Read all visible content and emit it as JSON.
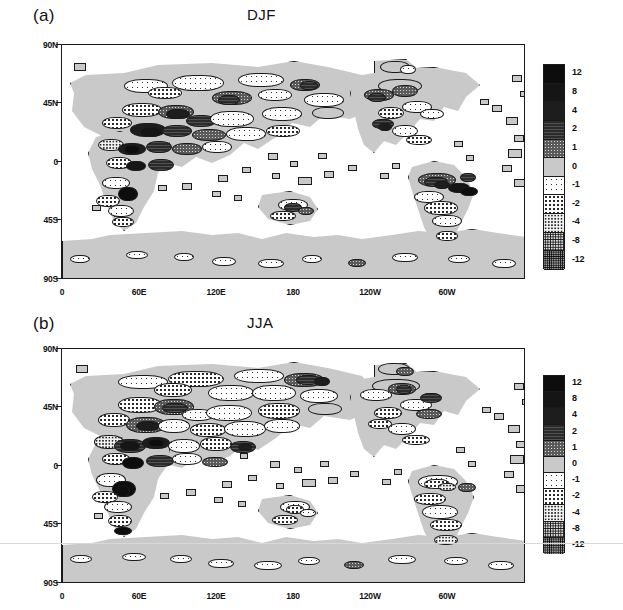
{
  "figure": {
    "panels": [
      {
        "tag": "(a)",
        "title": "DJF",
        "axes": {
          "ylabels": [
            "90N",
            "45N",
            "0",
            "45S",
            "90S"
          ],
          "xlabels": [
            "0",
            "60E",
            "120E",
            "180",
            "120W",
            "60W"
          ],
          "ylim": [
            -90,
            90
          ],
          "xlim": [
            0,
            360
          ]
        }
      },
      {
        "tag": "(b)",
        "title": "JJA",
        "axes": {
          "ylabels": [
            "90N",
            "45N",
            "0",
            "45S",
            "90S"
          ],
          "xlabels": [
            "0",
            "60E",
            "120E",
            "180",
            "120W",
            "60W"
          ],
          "ylim": [
            -90,
            90
          ],
          "xlim": [
            0,
            360
          ]
        }
      }
    ],
    "colorbar": {
      "labels": [
        "12",
        "8",
        "4",
        "2",
        "1",
        "0",
        "-1",
        "-2",
        "-4",
        "-8",
        "-12"
      ],
      "classes": [
        "f-p12",
        "f-p8",
        "f-p4",
        "f-p2",
        "f-p1",
        "f-p0",
        "f-m1",
        "f-m2",
        "f-m4",
        "f-m8",
        "f-m12"
      ]
    }
  },
  "chart_data": {
    "type": "heatmap",
    "panels": [
      {
        "label": "(a)",
        "title": "DJF",
        "xlabel": "",
        "ylabel": "",
        "xlim": [
          0,
          360
        ],
        "ylim": [
          -90,
          90
        ],
        "xticks": [
          0,
          60,
          120,
          180,
          240,
          300
        ],
        "xticklabels": [
          "0",
          "60E",
          "120E",
          "180",
          "120W",
          "60W"
        ],
        "yticks": [
          90,
          45,
          0,
          -45,
          -90
        ],
        "yticklabels": [
          "90N",
          "45N",
          "0",
          "45S",
          "90S"
        ],
        "grid": false
      },
      {
        "label": "(b)",
        "title": "JJA",
        "xlabel": "",
        "ylabel": "",
        "xlim": [
          0,
          360
        ],
        "ylim": [
          -90,
          90
        ],
        "xticks": [
          0,
          60,
          120,
          180,
          240,
          300
        ],
        "xticklabels": [
          "0",
          "60E",
          "120E",
          "180",
          "120W",
          "60W"
        ],
        "yticks": [
          90,
          45,
          0,
          -45,
          -90
        ],
        "yticklabels": [
          "90N",
          "45N",
          "0",
          "45S",
          "90S"
        ],
        "grid": false
      }
    ],
    "colorbar": {
      "orientation": "vertical",
      "tick_values": [
        12,
        8,
        4,
        2,
        1,
        0,
        -1,
        -2,
        -4,
        -8,
        -12
      ],
      "levels": [
        -12,
        -8,
        -4,
        -2,
        -1,
        0,
        1,
        2,
        4,
        8,
        12
      ],
      "legend_position": "right"
    }
  }
}
